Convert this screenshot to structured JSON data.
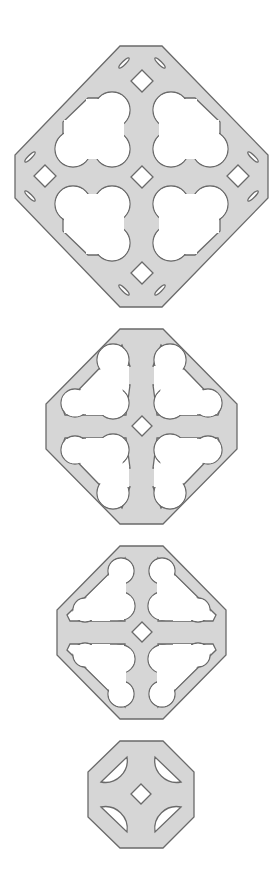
{
  "figure": {
    "colors": {
      "plate": "#d6d6d6",
      "outline": "#6a6a6a",
      "background": "#ffffff"
    },
    "panels": [
      {
        "id": "panel-1",
        "holes": "4 trefoil cut-outs, 5 diamonds, 8 slot cut-outs"
      },
      {
        "id": "panel-2",
        "holes": "4 lobed triangular cut-outs, 1 diamond"
      },
      {
        "id": "panel-3",
        "holes": "4 lobed triangular cut-outs, 1 diamond"
      },
      {
        "id": "panel-4",
        "holes": "4 half-round cut-outs, 1 diamond"
      }
    ]
  }
}
